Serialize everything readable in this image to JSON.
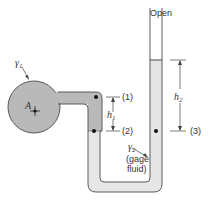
{
  "diagram": {
    "type": "U-tube manometer",
    "colors": {
      "tank_fluid": "#b9b9b9",
      "gage_fluid": "#e6e6e6",
      "outline": "#5a5a5a",
      "text": "#333333",
      "background": "#ffffff"
    },
    "labels": {
      "open": "Open",
      "tank_specific_weight": "γ",
      "tank_specific_weight_sub": "1",
      "tank_point": "A",
      "point1": "(1)",
      "point2": "(2)",
      "point3": "(3)",
      "h1": "h",
      "h1_sub": "1",
      "h2": "h",
      "h2_sub": "2",
      "gage_gamma": "γ",
      "gage_gamma_sub": "2",
      "gage_line1": "(gage",
      "gage_line2": "fluid)"
    }
  }
}
